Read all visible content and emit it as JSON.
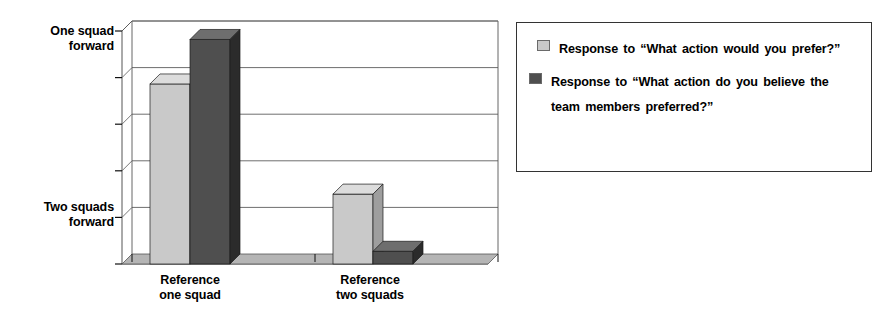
{
  "chart_data": {
    "type": "bar",
    "title": "",
    "xlabel": "",
    "ylabel": "",
    "three_d": true,
    "grid": true,
    "legend_position": "right",
    "categories": [
      "Reference one squad",
      "Reference two squads"
    ],
    "y_axis": {
      "tick_labels": [
        "One squad\nforward",
        "Two squads\nforward"
      ],
      "tick_values": [
        1.0,
        0.2
      ],
      "ylim": [
        0,
        1.1
      ],
      "gridline_values": [
        1.1,
        0.88,
        0.66,
        0.44,
        0.22
      ]
    },
    "series": [
      {
        "name": "Response to “What action would you\nprefer?”",
        "color": "#c9c9c9",
        "values": [
          0.85,
          0.33
        ]
      },
      {
        "name": "Response to “What action do you believe\nthe team members preferred?”",
        "color": "#4f4f4f",
        "values": [
          1.06,
          0.06
        ]
      }
    ]
  },
  "y_axis_labels": {
    "top": "One squad\nforward",
    "bottom": "Two squads\nforward"
  },
  "x_axis_labels": {
    "group_0": "Reference\none squad",
    "group_1": "Reference\ntwo squads"
  },
  "legend": {
    "entries": [
      {
        "swatch_color": "#c9c9c9",
        "label": "Response to “What action would you prefer?”"
      },
      {
        "swatch_color": "#4f4f4f",
        "label": "Response to “What action do you believe the team members preferred?”"
      }
    ]
  },
  "colors": {
    "series_light_front": "#c9c9c9",
    "series_light_side": "#9e9e9e",
    "series_light_top": "#dcdcdc",
    "series_dark_front": "#4f4f4f",
    "series_dark_side": "#2b2b2b",
    "series_dark_top": "#6e6e6e",
    "floor": "#b5b5b5",
    "axis": "#555555",
    "gridline": "#6e6e6e",
    "background": "#ffffff",
    "text": "#000000"
  }
}
